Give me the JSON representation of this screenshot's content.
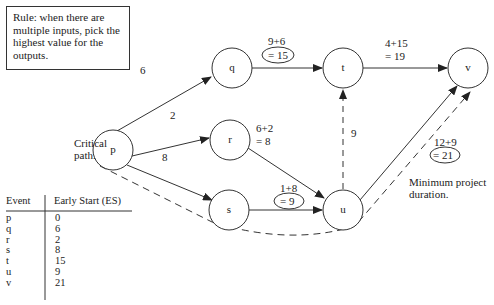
{
  "rule_box": {
    "text": "Rule: when there are multiple inputs, pick the highest value for the outputs."
  },
  "nodes": [
    {
      "id": "p",
      "label": "p",
      "cx": 113,
      "cy": 150
    },
    {
      "id": "q",
      "label": "q",
      "cx": 232,
      "cy": 68
    },
    {
      "id": "r",
      "label": "r",
      "cx": 230,
      "cy": 140
    },
    {
      "id": "s",
      "label": "s",
      "cx": 229,
      "cy": 210
    },
    {
      "id": "t",
      "label": "t",
      "cx": 343,
      "cy": 68
    },
    {
      "id": "u",
      "label": "u",
      "cx": 343,
      "cy": 210
    },
    {
      "id": "v",
      "label": "v",
      "cx": 468,
      "cy": 68
    }
  ],
  "edges": [
    {
      "from": "p",
      "to": "q",
      "label": "6",
      "dashed": false
    },
    {
      "from": "p",
      "to": "r",
      "label": "2",
      "dashed": false
    },
    {
      "from": "p",
      "to": "s",
      "label": "8",
      "dashed": false
    },
    {
      "from": "q",
      "to": "t",
      "label": "9+6 = 15",
      "dashed": false
    },
    {
      "from": "r",
      "to": "u",
      "label": "6+2 = 8",
      "dashed": false
    },
    {
      "from": "s",
      "to": "u",
      "label": "1+8 = 9",
      "dashed": false
    },
    {
      "from": "u",
      "to": "t",
      "label": "9",
      "dashed": true
    },
    {
      "from": "t",
      "to": "v",
      "label": "4+15 = 19",
      "dashed": false
    },
    {
      "from": "u",
      "to": "v",
      "label": "12+9 = 21",
      "dashed": false
    }
  ],
  "labels": {
    "pq": "6",
    "pr": "2",
    "ps": "8",
    "qt_line1": "9+6",
    "qt_line2": "= 15",
    "tv_line1": "4+15",
    "tv_line2": "= 19",
    "ru_line1": "6+2",
    "ru_line2": "= 8",
    "ut": "9",
    "su_line1": "1+8",
    "su_line2": "= 9",
    "uv_line1": "12+9",
    "uv_line2": "= 21",
    "critical_path_line1": "Critical",
    "critical_path_line2": "path.",
    "min_duration_line1": "Minimum project",
    "min_duration_line2": "duration."
  },
  "table": {
    "headers": [
      "Event",
      "Early Start (ES)"
    ],
    "rows": [
      {
        "event": "p",
        "es": "0"
      },
      {
        "event": "q",
        "es": "6"
      },
      {
        "event": "r",
        "es": "2"
      },
      {
        "event": "s",
        "es": "8"
      },
      {
        "event": "t",
        "es": "15"
      },
      {
        "event": "u",
        "es": "9"
      },
      {
        "event": "v",
        "es": "21"
      }
    ]
  },
  "colors": {
    "line": "#333333",
    "background": "#ffffff"
  }
}
